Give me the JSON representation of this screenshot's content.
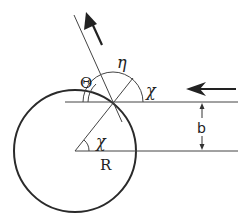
{
  "diagram": {
    "labels": {
      "theta": "Θ",
      "eta": "η",
      "chi_top": "χ",
      "chi_center": "χ",
      "radius": "R",
      "impact_parameter": "b"
    },
    "colors": {
      "stroke": "#2a2a2a",
      "background": "#ffffff"
    },
    "elements": [
      "circle (scatterer of radius R)",
      "incoming ray (horizontal, from right, arrow pointing left)",
      "axis line through circle center",
      "reflected ray (arrow pointing up-left)",
      "normal line at impact point",
      "angle arcs: Θ, η, χ",
      "impact parameter b (double arrow)"
    ]
  }
}
